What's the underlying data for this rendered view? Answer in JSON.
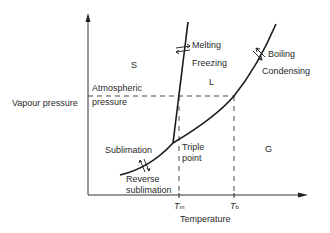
{
  "diagram": {
    "axes": {
      "y_label": "Vapour pressure",
      "x_label": "Temperature",
      "atmospheric_label_line1": "Atmospheric",
      "atmospheric_label_line2": "pressure",
      "tm_label": "T",
      "tm_sub": "m",
      "tb_label": "T",
      "tb_sub": "b"
    },
    "regions": {
      "solid": "S",
      "liquid": "L",
      "gas": "G"
    },
    "transitions": {
      "melting": "Melting",
      "freezing": "Freezing",
      "boiling": "Boiling",
      "condensing": "Condensing",
      "sublimation": "Sublimation",
      "reverse_line1": "Reverse",
      "reverse_line2": "sublimation",
      "triple_line1": "Triple",
      "triple_line2": "point"
    },
    "colors": {
      "line": "#1a1a1a",
      "text": "#2a2a2a"
    }
  }
}
